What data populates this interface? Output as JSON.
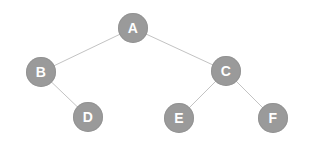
{
  "diagram": {
    "background_color": "#ffffff",
    "node_fill_color": "#9a9a9a",
    "node_label_color": "#ffffff",
    "edge_color": "#c3c3c3",
    "node_radius": 15,
    "nodes": [
      {
        "id": "A",
        "label": "A",
        "cx": 133,
        "cy": 28
      },
      {
        "id": "B",
        "label": "B",
        "cx": 41,
        "cy": 72
      },
      {
        "id": "C",
        "label": "C",
        "cx": 226,
        "cy": 71
      },
      {
        "id": "D",
        "label": "D",
        "cx": 88,
        "cy": 117
      },
      {
        "id": "E",
        "label": "E",
        "cx": 179,
        "cy": 118
      },
      {
        "id": "F",
        "label": "F",
        "cx": 273,
        "cy": 118
      }
    ],
    "edges": [
      {
        "id": "A-B",
        "from": "A",
        "to": "B",
        "x1": 133,
        "y1": 28,
        "x2": 41,
        "y2": 72
      },
      {
        "id": "A-C",
        "from": "A",
        "to": "C",
        "x1": 133,
        "y1": 28,
        "x2": 226,
        "y2": 71
      },
      {
        "id": "B-D",
        "from": "B",
        "to": "D",
        "x1": 41,
        "y1": 72,
        "x2": 88,
        "y2": 117
      },
      {
        "id": "C-E",
        "from": "C",
        "to": "E",
        "x1": 226,
        "y1": 71,
        "x2": 179,
        "y2": 118
      },
      {
        "id": "C-F",
        "from": "C",
        "to": "F",
        "x1": 226,
        "y1": 71,
        "x2": 273,
        "y2": 118
      }
    ]
  }
}
